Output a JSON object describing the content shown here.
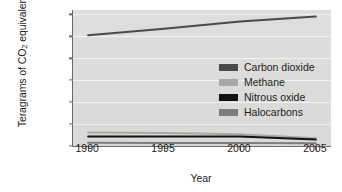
{
  "chart_data": {
    "type": "line",
    "title": "",
    "xlabel": "Year",
    "ylabel": "Teragrams of CO2 equivalents",
    "ylabel_prefix": "Teragrams of CO",
    "ylabel_sub": "2",
    "ylabel_suffix": " equivalents",
    "x": [
      1990,
      1995,
      2000,
      2005
    ],
    "xlim": [
      1989,
      2006
    ],
    "ylim": [
      0,
      6200
    ],
    "xticks": [
      "1990",
      "1995",
      "2000",
      "2005"
    ],
    "yticks": [
      "0",
      "1,000",
      "2,000",
      "3,000",
      "4,000",
      "5,000",
      "6,000"
    ],
    "ytick_values": [
      0,
      1000,
      2000,
      3000,
      4000,
      5000,
      6000
    ],
    "grid": true,
    "legend_position": "center-right",
    "series": [
      {
        "name": "Carbon dioxide",
        "color": "#4a4a4a",
        "values": [
          5050,
          5350,
          5680,
          5900
        ]
      },
      {
        "name": "Methane",
        "color": "#a8a8a6",
        "values": [
          620,
          590,
          540,
          350
        ]
      },
      {
        "name": "Nitrous oxide",
        "color": "#111111",
        "values": [
          430,
          430,
          430,
          300
        ]
      },
      {
        "name": "Halocarbons",
        "color": "#7d7d7b",
        "values": [
          150,
          140,
          140,
          130
        ]
      }
    ]
  }
}
